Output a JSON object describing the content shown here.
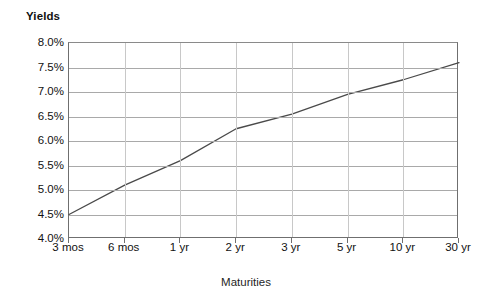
{
  "chart_data": {
    "type": "line",
    "title": "",
    "ylabel": "Yields",
    "xlabel": "Maturities",
    "categories": [
      "3 mos",
      "6 mos",
      "1 yr",
      "2 yr",
      "3 yr",
      "5 yr",
      "10 yr",
      "30 yr"
    ],
    "values": [
      4.5,
      5.1,
      5.6,
      6.25,
      6.55,
      6.95,
      7.25,
      7.6
    ],
    "ylim": [
      4.0,
      8.0
    ],
    "ytick_step": 0.5,
    "ytick_labels": [
      "4.0%",
      "4.5%",
      "5.0%",
      "5.5%",
      "6.0%",
      "6.5%",
      "7.0%",
      "7.5%",
      "8.0%"
    ],
    "ytick_values": [
      4.0,
      4.5,
      5.0,
      5.5,
      6.0,
      6.5,
      7.0,
      7.5,
      8.0
    ],
    "grid": "horizontal-and-vertical",
    "legend": "none",
    "series": [
      {
        "name": "Yield curve",
        "values": [
          4.5,
          5.1,
          5.6,
          6.25,
          6.55,
          6.95,
          7.25,
          7.6
        ]
      }
    ],
    "colors": {
      "line": "#4a4a4a",
      "hgrid": "#a9a9a9",
      "vgrid": "#c8c8c8",
      "frame": "#6f6f6f",
      "text": "#111111",
      "background": "#ffffff"
    }
  }
}
